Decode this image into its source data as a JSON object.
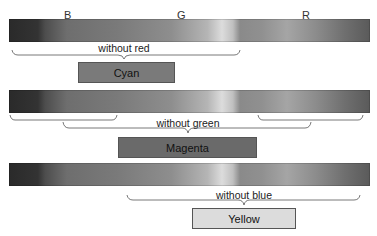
{
  "diagram": {
    "band_labels": [
      "B",
      "G",
      "R"
    ],
    "rows": [
      {
        "brace_label": "without red",
        "result_label": "Cyan",
        "result_color": "#7a7a7a"
      },
      {
        "brace_label": "without green",
        "result_label": "Magenta",
        "result_color": "#6a6a6a"
      },
      {
        "brace_label": "without blue",
        "result_label": "Yellow",
        "result_color": "#dcdcdc"
      }
    ]
  }
}
